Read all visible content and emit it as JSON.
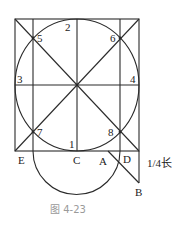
{
  "figure": {
    "caption": "图 4-23",
    "annotation": "1/4长",
    "colors": {
      "line": "#2a2a2a",
      "caption": "#9a9a9a"
    }
  },
  "points": {
    "E": "E",
    "C": "C",
    "A": "A",
    "D": "D",
    "B": "B"
  },
  "numbers": {
    "n1": "1",
    "n2": "2",
    "n3": "3",
    "n4": "4",
    "n5": "5",
    "n6": "6",
    "n7": "7",
    "n8": "8"
  }
}
